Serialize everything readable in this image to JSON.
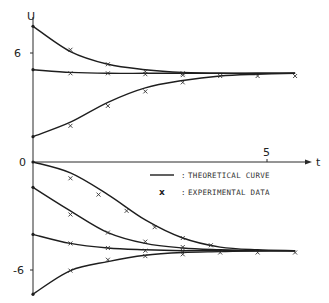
{
  "chart_data": {
    "type": "line",
    "title": "",
    "xlabel": "t",
    "ylabel": "U",
    "x_ticks": [
      {
        "value": 5,
        "label": "5"
      }
    ],
    "y_ticks": [
      {
        "value": 6,
        "label": "6"
      },
      {
        "value": 0,
        "label": "0"
      },
      {
        "value": -6,
        "label": "-6"
      }
    ],
    "xlim": [
      0,
      6.4
    ],
    "ylim": [
      -7.8,
      8.4
    ],
    "grid": false,
    "legend": {
      "position": "center-right, below t-axis",
      "entries": [
        {
          "symbol": "line",
          "label": "THEORETICAL CURVE"
        },
        {
          "symbol": "x",
          "label": "EXPERIMENTAL DATA"
        }
      ]
    },
    "x_samples": [
      0,
      0.8,
      1.6,
      2.4,
      3.2,
      4.0,
      4.8,
      5.6
    ],
    "series": [
      {
        "name": "upper curve from 7.5",
        "group": "upper",
        "theoretical": [
          [
            0,
            7.5
          ],
          [
            0.8,
            6.1
          ],
          [
            1.6,
            5.4
          ],
          [
            2.4,
            5.1
          ],
          [
            3.2,
            4.95
          ],
          [
            4.0,
            4.9
          ],
          [
            4.8,
            4.9
          ],
          [
            5.6,
            4.9
          ]
        ],
        "experimental": [
          [
            0.8,
            6.2
          ],
          [
            1.6,
            5.4
          ],
          [
            2.4,
            5.0
          ],
          [
            3.2,
            4.9
          ]
        ]
      },
      {
        "name": "upper curve from 5.1",
        "group": "upper",
        "theoretical": [
          [
            0,
            5.1
          ],
          [
            0.8,
            4.95
          ],
          [
            1.6,
            4.9
          ],
          [
            2.4,
            4.9
          ],
          [
            3.2,
            4.9
          ],
          [
            4.0,
            4.9
          ],
          [
            4.8,
            4.9
          ],
          [
            5.6,
            4.9
          ]
        ],
        "experimental": [
          [
            0.8,
            4.9
          ],
          [
            1.6,
            4.9
          ],
          [
            2.4,
            4.85
          ],
          [
            3.2,
            4.8
          ],
          [
            4.0,
            4.75
          ],
          [
            4.8,
            4.75
          ],
          [
            5.6,
            4.75
          ]
        ]
      },
      {
        "name": "upper curve from 1.4",
        "group": "upper",
        "theoretical": [
          [
            0,
            1.4
          ],
          [
            0.8,
            2.2
          ],
          [
            1.6,
            3.3
          ],
          [
            2.4,
            4.1
          ],
          [
            3.2,
            4.5
          ],
          [
            4.0,
            4.75
          ],
          [
            4.8,
            4.85
          ],
          [
            5.6,
            4.9
          ]
        ],
        "experimental": [
          [
            0.8,
            2.0
          ],
          [
            1.6,
            3.1
          ],
          [
            2.4,
            3.9
          ],
          [
            3.2,
            4.4
          ]
        ]
      },
      {
        "name": "lower curve from 0",
        "group": "lower",
        "theoretical": [
          [
            0,
            0
          ],
          [
            0.8,
            -0.6
          ],
          [
            1.6,
            -1.8
          ],
          [
            2.4,
            -3.2
          ],
          [
            3.2,
            -4.2
          ],
          [
            4.0,
            -4.7
          ],
          [
            4.8,
            -4.85
          ],
          [
            5.6,
            -4.9
          ]
        ],
        "experimental": [
          [
            0.8,
            -0.9
          ],
          [
            1.4,
            -1.8
          ],
          [
            2.0,
            -2.7
          ],
          [
            2.6,
            -3.6
          ],
          [
            3.2,
            -4.2
          ],
          [
            3.8,
            -4.6
          ]
        ]
      },
      {
        "name": "lower curve from -1.4",
        "group": "lower",
        "theoretical": [
          [
            0,
            -1.4
          ],
          [
            0.8,
            -2.7
          ],
          [
            1.6,
            -3.9
          ],
          [
            2.4,
            -4.5
          ],
          [
            3.2,
            -4.75
          ],
          [
            4.0,
            -4.85
          ],
          [
            4.8,
            -4.9
          ],
          [
            5.6,
            -4.9
          ]
        ],
        "experimental": [
          [
            0.8,
            -2.9
          ],
          [
            1.6,
            -3.9
          ],
          [
            2.4,
            -4.4
          ],
          [
            3.2,
            -4.7
          ]
        ]
      },
      {
        "name": "lower curve from -4.0",
        "group": "lower",
        "theoretical": [
          [
            0,
            -4.0
          ],
          [
            0.8,
            -4.5
          ],
          [
            1.6,
            -4.75
          ],
          [
            2.4,
            -4.85
          ],
          [
            3.2,
            -4.9
          ],
          [
            4.0,
            -4.9
          ],
          [
            4.8,
            -4.9
          ],
          [
            5.6,
            -4.9
          ]
        ],
        "experimental": [
          [
            0.8,
            -4.5
          ],
          [
            1.6,
            -4.75
          ],
          [
            2.4,
            -4.9
          ],
          [
            3.2,
            -4.9
          ],
          [
            4.0,
            -5.0
          ],
          [
            4.8,
            -5.0
          ],
          [
            5.6,
            -5.0
          ]
        ]
      },
      {
        "name": "lower curve from -7.3",
        "group": "lower",
        "theoretical": [
          [
            0,
            -7.3
          ],
          [
            0.8,
            -6.0
          ],
          [
            1.6,
            -5.5
          ],
          [
            2.4,
            -5.15
          ],
          [
            3.2,
            -5.0
          ],
          [
            4.0,
            -4.95
          ],
          [
            4.8,
            -4.9
          ],
          [
            5.6,
            -4.9
          ]
        ],
        "experimental": [
          [
            0.8,
            -6.0
          ],
          [
            1.6,
            -5.4
          ],
          [
            2.4,
            -5.2
          ],
          [
            3.2,
            -5.1
          ]
        ]
      }
    ]
  },
  "labels": {
    "y_axis": "U",
    "x_axis": "t",
    "tick_6": "6",
    "tick_0": "0",
    "tick_neg6": "-6",
    "tick_5": "5",
    "legend_line": "THEORETICAL CURVE",
    "legend_marker": "EXPERIMENTAL DATA",
    "legend_sep": ":",
    "marker_glyph": "x"
  }
}
